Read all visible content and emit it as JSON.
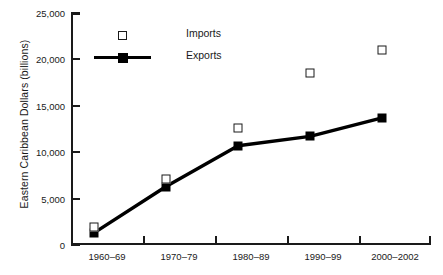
{
  "chart_data": {
    "type": "line",
    "title": "",
    "xlabel": "",
    "ylabel": "Eastern Caribbean Dollars (billions)",
    "categories": [
      "1960–69",
      "1970–79",
      "1980–89",
      "1990–99",
      "2000–2002"
    ],
    "series": [
      {
        "name": "Imports",
        "marker": "open-square",
        "line": false,
        "values": [
          1900,
          7100,
          12600,
          18500,
          21000
        ]
      },
      {
        "name": "Exports",
        "marker": "filled-square",
        "line": true,
        "values": [
          1300,
          6300,
          10700,
          11700,
          13700
        ]
      }
    ],
    "ylim": [
      0,
      25000
    ],
    "yticks": [
      0,
      5000,
      10000,
      15000,
      20000,
      25000
    ],
    "ytick_labels": [
      "0",
      "5,000",
      "10,000",
      "15,000",
      "20,000",
      "25,000"
    ],
    "grid": false,
    "legend_position": "upper-left-inside",
    "colors": {
      "axis": "#1a1a1a",
      "exports": "#000000",
      "imports_fill": "#ffffff",
      "imports_edge": "#1a1a1a"
    }
  },
  "legend": {
    "imports_label": "Imports",
    "exports_label": "Exports"
  }
}
